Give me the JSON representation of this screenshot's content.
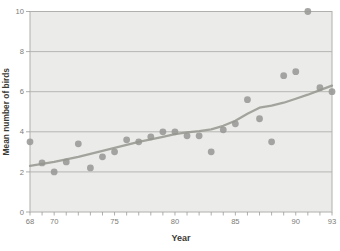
{
  "figure": {
    "xlabel": "Year",
    "ylabel": "Mean number of birds"
  },
  "chart_data": {
    "type": "scatter",
    "title": "",
    "xlabel": "Year",
    "ylabel": "Mean number of birds",
    "xlim": [
      68,
      93
    ],
    "ylim": [
      0,
      10
    ],
    "x_ticks_minor": [
      68,
      69,
      70,
      71,
      72,
      73,
      74,
      75,
      76,
      77,
      78,
      79,
      80,
      81,
      82,
      83,
      84,
      85,
      86,
      87,
      88,
      89,
      90,
      91,
      92,
      93
    ],
    "x_ticks_labeled": [
      68,
      70,
      75,
      80,
      85,
      90,
      93
    ],
    "y_ticks": [
      0,
      2,
      4,
      6,
      8,
      10
    ],
    "gridlines_y": [
      2,
      4,
      6,
      8
    ],
    "grid": true,
    "legend": "none",
    "series": [
      {
        "name": "mean-number-of-birds",
        "type": "scatter",
        "x": [
          68,
          69,
          70,
          71,
          72,
          73,
          74,
          75,
          76,
          77,
          78,
          79,
          80,
          81,
          82,
          83,
          84,
          85,
          86,
          87,
          88,
          89,
          90,
          91,
          92,
          93
        ],
        "y": [
          3.5,
          2.45,
          2.0,
          2.5,
          3.4,
          2.2,
          2.75,
          3.0,
          3.6,
          3.5,
          3.75,
          4.0,
          4.0,
          3.8,
          3.8,
          3.0,
          4.1,
          4.4,
          5.6,
          4.65,
          3.5,
          6.8,
          7.0,
          10.0,
          6.2,
          6.0
        ]
      },
      {
        "name": "smoothed-trend",
        "type": "line",
        "x": [
          68,
          69,
          70,
          71,
          72,
          73,
          74,
          75,
          76,
          77,
          78,
          79,
          80,
          81,
          82,
          83,
          84,
          85,
          86,
          87,
          88,
          89,
          90,
          91,
          92,
          93
        ],
        "y": [
          2.3,
          2.4,
          2.5,
          2.62,
          2.75,
          2.9,
          3.05,
          3.2,
          3.35,
          3.5,
          3.62,
          3.75,
          3.88,
          3.97,
          4.03,
          4.12,
          4.3,
          4.55,
          4.9,
          5.2,
          5.3,
          5.45,
          5.65,
          5.85,
          6.08,
          6.3
        ]
      }
    ],
    "colors": {
      "plot_background": "#ebebe9",
      "gridline": "#a7a7a4",
      "border": "#b0b0ad",
      "point": "#999996",
      "trend_line": "#96968f",
      "tick": "#9a9a97",
      "tick_label": "#7c7c76",
      "axis_title": "#3b3b36"
    }
  }
}
